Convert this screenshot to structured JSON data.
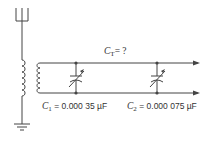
{
  "diagram": {
    "title_label": {
      "symbol": "C",
      "subscript": "T",
      "value": "= ?"
    },
    "capacitors": [
      {
        "symbol": "C",
        "subscript": "1",
        "value": "= 0.000 35 µF"
      },
      {
        "symbol": "C",
        "subscript": "2",
        "value": "= 0.000 075 µF"
      }
    ],
    "components": [
      "antenna",
      "primary-coil",
      "secondary-coil",
      "variable-capacitor-c1",
      "variable-capacitor-c2",
      "ground",
      "output-arrows"
    ],
    "colors": {
      "line": "#444444",
      "text": "#333333",
      "background": "#ffffff"
    }
  }
}
